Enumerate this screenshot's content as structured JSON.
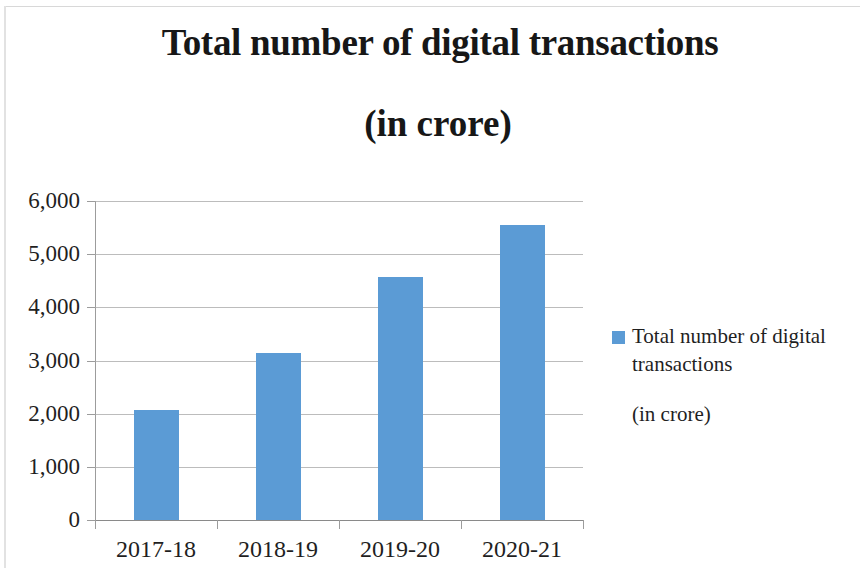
{
  "figure": {
    "background_color": "#ffffff",
    "border_color": "#d8d8d8"
  },
  "title": {
    "line1": "Total number of digital transactions",
    "line2": "(in crore)"
  },
  "legend": {
    "marker_icon": "legend-square-icon",
    "label": "Total number of digital transactions",
    "sublabel": "(in crore)",
    "position": "right"
  },
  "chart_data": {
    "type": "bar",
    "title": "Total number of digital transactions (in crore)",
    "categories": [
      "2017-18",
      "2018-19",
      "2019-20",
      "2020-21"
    ],
    "values": [
      2071,
      3134,
      4572,
      5554
    ],
    "series": [
      {
        "name": "Total number of digital transactions (in crore)",
        "values": [
          2071,
          3134,
          4572,
          5554
        ],
        "color": "#5b9bd5"
      }
    ],
    "xlabel": "",
    "ylabel": "",
    "ylim": [
      0,
      6000
    ],
    "ytick_labels": [
      "6,000",
      "5,000",
      "4,000",
      "3,000",
      "2,000",
      "1,000",
      "0"
    ],
    "ytick_values": [
      6000,
      5000,
      4000,
      3000,
      2000,
      1000,
      0
    ],
    "grid": true,
    "grid_axis": "y",
    "legend_position": "right"
  }
}
